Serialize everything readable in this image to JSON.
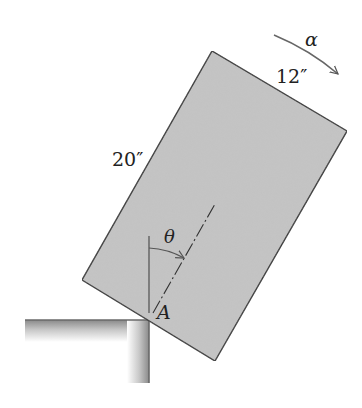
{
  "figure": {
    "type": "rigid-body-dynamics",
    "labels": {
      "angular_acceleration": "α",
      "width_dim": "12″",
      "height_dim": "20″",
      "angle": "θ",
      "pivot": "A"
    },
    "colors": {
      "block_fill": "#c4c4c4",
      "outline": "#2a2a2a",
      "text": "#222222",
      "support_edge": "#6a6a6a"
    }
  }
}
